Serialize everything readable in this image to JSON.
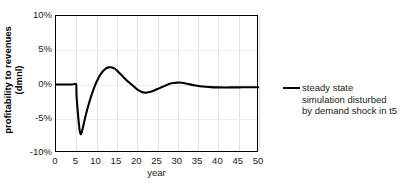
{
  "chart_data": {
    "type": "line",
    "title": "",
    "xlabel": "year",
    "ylabel_line1": "profitability to revenues",
    "ylabel_line2": "(dmnl)",
    "xlim": [
      0,
      50
    ],
    "ylim": [
      -10,
      10
    ],
    "xticks": [
      0,
      5,
      10,
      15,
      20,
      25,
      30,
      35,
      40,
      45,
      50
    ],
    "xticklabels": [
      "0",
      "5",
      "10",
      "15",
      "20",
      "25",
      "30",
      "35",
      "40",
      "45",
      "50"
    ],
    "yticks": [
      10,
      5,
      0,
      -5,
      -10
    ],
    "yticklabels": [
      "10%",
      "5%",
      "0%",
      "-5%",
      "-10%"
    ],
    "grid": true,
    "legend_position": "right",
    "line_color": "#000000",
    "grid_color": "#e2e2e2",
    "series": [
      {
        "name": "steady state simulation disturbed by demand shock in t5",
        "legend_label_lines": [
          "steady state",
          "simulation disturbed",
          "by demand shock in t5"
        ],
        "x": [
          0,
          1,
          2,
          3,
          4,
          5,
          5.05,
          5.4,
          5.8,
          6.1,
          6.5,
          7,
          7.5,
          8,
          8.5,
          9,
          9.5,
          10,
          10.5,
          11,
          11.5,
          12,
          12.5,
          13,
          13.5,
          14,
          14.5,
          15,
          15.5,
          16,
          16.5,
          17,
          17.5,
          18,
          18.5,
          19,
          19.5,
          20,
          20.5,
          21,
          21.5,
          22,
          22.5,
          23,
          24,
          25,
          26,
          27,
          28,
          29,
          30,
          31,
          32,
          33,
          34,
          35,
          36,
          38,
          40,
          42,
          44,
          46,
          48,
          50
        ],
        "y": [
          0,
          0,
          0,
          0,
          0,
          0,
          -1.5,
          -4.2,
          -6.6,
          -7.3,
          -6.6,
          -5.3,
          -4.1,
          -3.0,
          -2.0,
          -1.1,
          -0.3,
          0.4,
          1.0,
          1.5,
          1.9,
          2.2,
          2.4,
          2.5,
          2.52,
          2.45,
          2.3,
          2.05,
          1.75,
          1.45,
          1.15,
          0.85,
          0.55,
          0.3,
          0.05,
          -0.2,
          -0.45,
          -0.7,
          -0.9,
          -1.05,
          -1.15,
          -1.2,
          -1.18,
          -1.1,
          -0.9,
          -0.65,
          -0.4,
          -0.15,
          0.1,
          0.22,
          0.28,
          0.25,
          0.15,
          0.02,
          -0.1,
          -0.22,
          -0.3,
          -0.38,
          -0.42,
          -0.43,
          -0.42,
          -0.41,
          -0.4,
          -0.4
        ],
        "annotations": {
          "shock_year": 5,
          "trough_value": -7.3,
          "trough_year": 6.1,
          "peak_value": 2.52,
          "peak_year": 13.5,
          "settling_value": -0.4
        }
      }
    ]
  }
}
